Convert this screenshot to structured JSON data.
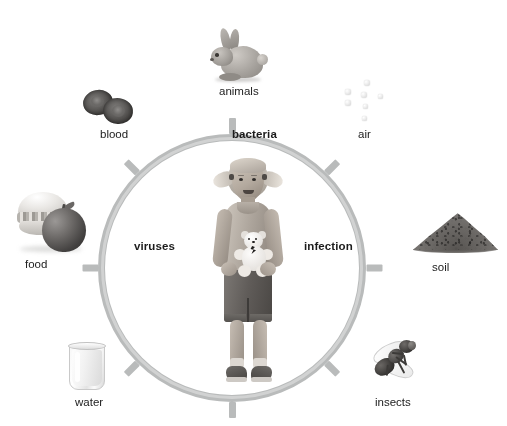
{
  "diagram": {
    "center_figure": {
      "name": "girl-holding-teddy-bear",
      "description": "girl with pigtails holding a teddy bear"
    },
    "ring": {
      "color": "#b9bbbb",
      "tick_count": 8,
      "inner_labels": [
        {
          "id": "bacteria",
          "label": "bacteria",
          "position": "top"
        },
        {
          "id": "viruses",
          "label": "viruses",
          "position": "left"
        },
        {
          "id": "infection",
          "label": "infection",
          "position": "right"
        }
      ]
    },
    "sources": [
      {
        "id": "animals",
        "label": "animals",
        "icon": "rabbit-icon",
        "angle_deg": 90
      },
      {
        "id": "blood",
        "label": "blood",
        "icon": "blood-cells-icon",
        "angle_deg": 135
      },
      {
        "id": "air",
        "label": "air",
        "icon": "air-droplets-icon",
        "angle_deg": 45
      },
      {
        "id": "food",
        "label": "food",
        "icon": "burger-apple-icon",
        "angle_deg": 180
      },
      {
        "id": "soil",
        "label": "soil",
        "icon": "soil-mound-icon",
        "angle_deg": 0
      },
      {
        "id": "water",
        "label": "water",
        "icon": "water-glass-icon",
        "angle_deg": 225
      },
      {
        "id": "insects",
        "label": "insects",
        "icon": "fly-icon",
        "angle_deg": 315
      }
    ],
    "colors": {
      "ring": "#b9bbbb",
      "label_text": "#222222",
      "inner_label_text": "#1c1c1c",
      "background": "#ffffff"
    }
  }
}
